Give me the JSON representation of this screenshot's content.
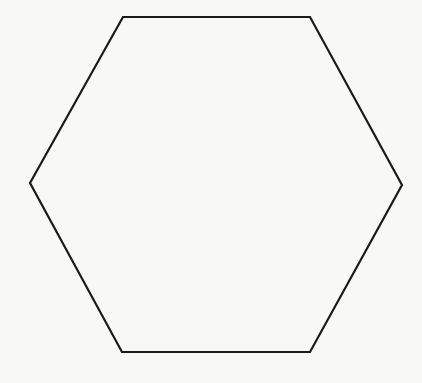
{
  "diagram": {
    "shape": "hexagon",
    "background_color": "#f8f8f7",
    "stroke_color": "#1a1a1a",
    "stroke_width": 2.2,
    "fill": "none",
    "vertices": [
      [
        123,
        17
      ],
      [
        310,
        17
      ],
      [
        402,
        185
      ],
      [
        310,
        352
      ],
      [
        122,
        352
      ],
      [
        30,
        183
      ]
    ],
    "points": "123,17 310,17 402,185 310,352 122,352 30,183"
  }
}
